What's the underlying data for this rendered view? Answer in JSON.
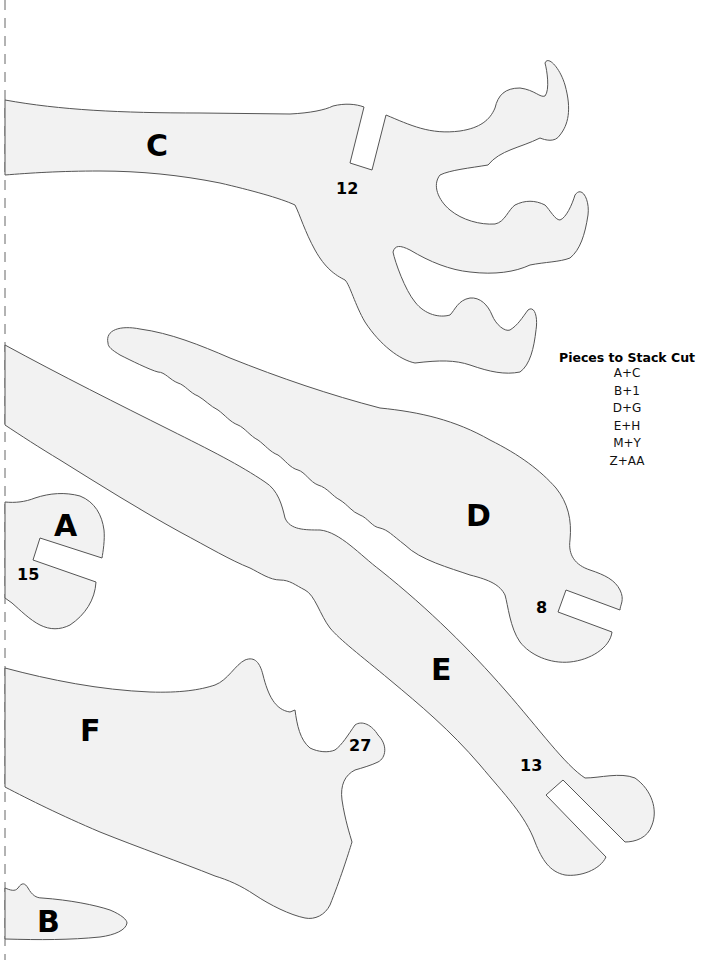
{
  "page": {
    "background": "#ffffff",
    "piece_fill": "#f2f2f2",
    "piece_outline": "#555555"
  },
  "pieces": {
    "C": {
      "letter": "C",
      "slot_number": "12"
    },
    "D": {
      "letter": "D",
      "slot_number": "8"
    },
    "E": {
      "letter": "E",
      "slot_number": "13"
    },
    "A": {
      "letter": "A",
      "slot_number": "15"
    },
    "F": {
      "letter": "F",
      "slot_number": "27"
    },
    "B": {
      "letter": "B"
    }
  },
  "stack_cut": {
    "title": "Pieces to Stack Cut",
    "items": [
      "A+C",
      "B+1",
      "D+G",
      "E+H",
      "M+Y",
      "Z+AA"
    ]
  }
}
